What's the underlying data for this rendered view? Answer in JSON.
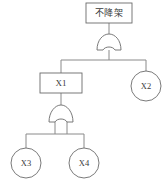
{
  "diagram": {
    "type": "fault-tree",
    "title_node": {
      "id": "top-event",
      "shape": "rectangle",
      "label": "不降架"
    },
    "gates": [
      {
        "id": "gate-top",
        "type": "OR",
        "symbol_name": "or-gate"
      },
      {
        "id": "gate-lower",
        "type": "OR",
        "symbol_name": "or-gate"
      }
    ],
    "nodes": [
      {
        "id": "x1",
        "shape": "rectangle",
        "label": "X1"
      },
      {
        "id": "x2",
        "shape": "circle",
        "label": "X2"
      },
      {
        "id": "x3",
        "shape": "circle",
        "label": "X3"
      },
      {
        "id": "x4",
        "shape": "circle",
        "label": "X4"
      }
    ],
    "colors": {
      "background": "#ffffff",
      "stroke": "#6b6b6b",
      "connector": "#8a8a8a",
      "text": "#3a3a3a"
    }
  }
}
